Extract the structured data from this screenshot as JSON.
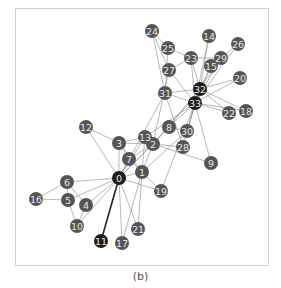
{
  "caption": "(b)",
  "colors": {
    "node_default": "#555555",
    "node_hub": "#1e1e1e",
    "node_label": "#e8e8e8",
    "edge": "#9a9a9a",
    "edge_strong": "#222222",
    "frame": "#cfcfcf"
  },
  "graph": {
    "node_radius": 7,
    "nodes": [
      {
        "id": "0",
        "x": 119,
        "y": 178,
        "hub": true
      },
      {
        "id": "1",
        "x": 142,
        "y": 172
      },
      {
        "id": "2",
        "x": 153,
        "y": 144
      },
      {
        "id": "3",
        "x": 119,
        "y": 143
      },
      {
        "id": "4",
        "x": 86,
        "y": 205
      },
      {
        "id": "5",
        "x": 68,
        "y": 200
      },
      {
        "id": "6",
        "x": 67,
        "y": 182
      },
      {
        "id": "7",
        "x": 129,
        "y": 159
      },
      {
        "id": "8",
        "x": 169,
        "y": 127
      },
      {
        "id": "9",
        "x": 211,
        "y": 163
      },
      {
        "id": "10",
        "x": 77,
        "y": 226
      },
      {
        "id": "11",
        "x": 101,
        "y": 241,
        "hub": true
      },
      {
        "id": "12",
        "x": 86,
        "y": 127
      },
      {
        "id": "13",
        "x": 145,
        "y": 137
      },
      {
        "id": "14",
        "x": 209,
        "y": 36
      },
      {
        "id": "15",
        "x": 211,
        "y": 66
      },
      {
        "id": "16",
        "x": 36,
        "y": 199
      },
      {
        "id": "17",
        "x": 122,
        "y": 243
      },
      {
        "id": "18",
        "x": 246,
        "y": 111
      },
      {
        "id": "19",
        "x": 161,
        "y": 191
      },
      {
        "id": "20",
        "x": 240,
        "y": 78
      },
      {
        "id": "21",
        "x": 138,
        "y": 229
      },
      {
        "id": "22",
        "x": 229,
        "y": 113
      },
      {
        "id": "23",
        "x": 191,
        "y": 58
      },
      {
        "id": "24",
        "x": 152,
        "y": 31
      },
      {
        "id": "25",
        "x": 168,
        "y": 48
      },
      {
        "id": "26",
        "x": 238,
        "y": 44
      },
      {
        "id": "27",
        "x": 169,
        "y": 70
      },
      {
        "id": "28",
        "x": 183,
        "y": 147
      },
      {
        "id": "29",
        "x": 221,
        "y": 58
      },
      {
        "id": "30",
        "x": 187,
        "y": 131
      },
      {
        "id": "31",
        "x": 165,
        "y": 93
      },
      {
        "id": "32",
        "x": 200,
        "y": 89,
        "hub": true
      },
      {
        "id": "33",
        "x": 195,
        "y": 103,
        "hub": true
      }
    ],
    "edges": [
      [
        0,
        1
      ],
      [
        0,
        2
      ],
      [
        0,
        3
      ],
      [
        0,
        4
      ],
      [
        0,
        5
      ],
      [
        0,
        6
      ],
      [
        0,
        7
      ],
      [
        0,
        8
      ],
      [
        0,
        10
      ],
      [
        0,
        11
      ],
      [
        0,
        12
      ],
      [
        0,
        13
      ],
      [
        0,
        17
      ],
      [
        0,
        19
      ],
      [
        0,
        21
      ],
      [
        0,
        31
      ],
      [
        1,
        2
      ],
      [
        1,
        3
      ],
      [
        1,
        7
      ],
      [
        1,
        13
      ],
      [
        1,
        17
      ],
      [
        1,
        19
      ],
      [
        1,
        21
      ],
      [
        1,
        30
      ],
      [
        2,
        3
      ],
      [
        2,
        7
      ],
      [
        2,
        8
      ],
      [
        2,
        9
      ],
      [
        2,
        13
      ],
      [
        2,
        27
      ],
      [
        2,
        28
      ],
      [
        2,
        32
      ],
      [
        3,
        7
      ],
      [
        3,
        12
      ],
      [
        3,
        13
      ],
      [
        4,
        6
      ],
      [
        4,
        10
      ],
      [
        5,
        6
      ],
      [
        5,
        10
      ],
      [
        5,
        16
      ],
      [
        6,
        16
      ],
      [
        8,
        30
      ],
      [
        8,
        32
      ],
      [
        8,
        33
      ],
      [
        9,
        33
      ],
      [
        13,
        33
      ],
      [
        14,
        32
      ],
      [
        14,
        33
      ],
      [
        15,
        32
      ],
      [
        15,
        33
      ],
      [
        18,
        32
      ],
      [
        18,
        33
      ],
      [
        19,
        33
      ],
      [
        20,
        32
      ],
      [
        20,
        33
      ],
      [
        22,
        32
      ],
      [
        22,
        33
      ],
      [
        23,
        25
      ],
      [
        23,
        27
      ],
      [
        23,
        29
      ],
      [
        23,
        32
      ],
      [
        23,
        33
      ],
      [
        24,
        25
      ],
      [
        24,
        27
      ],
      [
        24,
        31
      ],
      [
        25,
        31
      ],
      [
        26,
        29
      ],
      [
        26,
        33
      ],
      [
        27,
        33
      ],
      [
        28,
        31
      ],
      [
        28,
        33
      ],
      [
        29,
        32
      ],
      [
        29,
        33
      ],
      [
        30,
        32
      ],
      [
        30,
        33
      ],
      [
        31,
        32
      ],
      [
        31,
        33
      ],
      [
        32,
        33
      ]
    ],
    "strong_edges": [
      [
        0,
        11
      ]
    ]
  }
}
